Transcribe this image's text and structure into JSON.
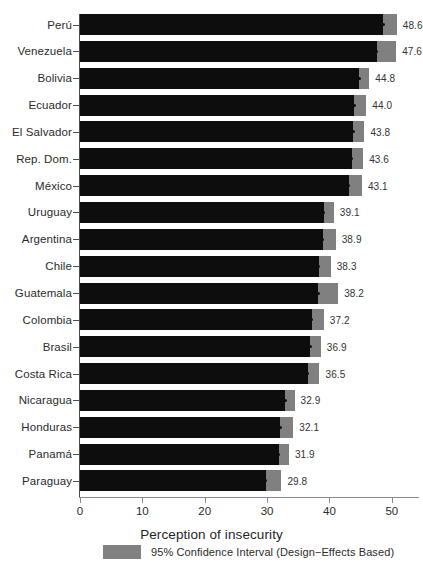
{
  "chart_data": {
    "type": "bar",
    "orientation": "horizontal",
    "title": "",
    "xlabel": "Perception of insecurity",
    "ylabel": "",
    "xlim": [
      0,
      55
    ],
    "xticks": [
      0,
      10,
      20,
      30,
      40,
      50
    ],
    "grid": false,
    "legend": {
      "position": "bottom",
      "entries": [
        {
          "label": "95% Confidence Interval (Design−Effects Based)",
          "color": "#808080"
        }
      ]
    },
    "colors": {
      "bar": "#0d0d0d",
      "ci": "#808080",
      "dot": "#0d0d0d",
      "axis": "#4d4d4d",
      "background": "#ffffff"
    },
    "categories": [
      "Perú",
      "Venezuela",
      "Bolivia",
      "Ecuador",
      "El Salvador",
      "Rep. Dom.",
      "México",
      "Uruguay",
      "Argentina",
      "Chile",
      "Guatemala",
      "Colombia",
      "Brasil",
      "Costa Rica",
      "Nicaragua",
      "Honduras",
      "Panamá",
      "Paraguay"
    ],
    "values": [
      48.6,
      47.6,
      44.8,
      44.0,
      43.8,
      43.6,
      43.1,
      39.1,
      38.9,
      38.3,
      38.2,
      37.2,
      36.9,
      36.5,
      32.9,
      32.1,
      31.9,
      29.8
    ],
    "value_labels": [
      "48.6",
      "47.6",
      "44.8",
      "44.0",
      "43.8",
      "43.6",
      "43.1",
      "39.1",
      "38.9",
      "38.3",
      "38.2",
      "37.2",
      "36.9",
      "36.5",
      "32.9",
      "32.1",
      "31.9",
      "29.8"
    ],
    "ci_low": [
      45.5,
      44.3,
      42.8,
      42.2,
      41.8,
      41.6,
      40.9,
      37.3,
      36.8,
      36.5,
      35.0,
      35.3,
      35.1,
      34.6,
      31.4,
      30.1,
      30.4,
      27.4
    ],
    "ci_high": [
      50.8,
      50.7,
      46.4,
      45.9,
      45.6,
      45.4,
      45.2,
      40.7,
      41.0,
      40.2,
      41.4,
      39.1,
      38.6,
      38.4,
      34.4,
      34.2,
      33.5,
      32.3
    ]
  }
}
